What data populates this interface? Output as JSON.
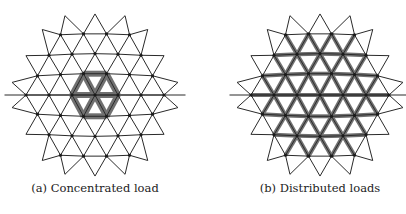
{
  "figure": {
    "panels": [
      {
        "id": "a",
        "caption": "(a) Concentrated load",
        "load": "concentrated"
      },
      {
        "id": "b",
        "caption": "(b) Distributed loads",
        "load": "distributed"
      }
    ],
    "colors": {
      "line": "#2a2a2a",
      "bar": "#707070",
      "node": "#1a1a1a"
    }
  }
}
